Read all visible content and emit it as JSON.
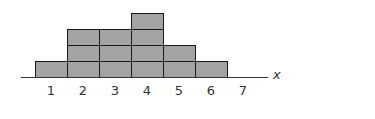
{
  "chart_data": {
    "type": "bar",
    "style": "stacked-unit-blocks histogram",
    "title": "",
    "xlabel": "x",
    "ylabel": "",
    "categories": [
      "1",
      "2",
      "3",
      "4",
      "5",
      "6",
      "7"
    ],
    "values": [
      1,
      3,
      3,
      4,
      2,
      1,
      0
    ],
    "ylim": [
      0,
      4
    ],
    "grid": false,
    "legend": null
  },
  "colors": {
    "block_fill": "#a3a3a3",
    "block_border": "#1a1a1a",
    "axis": "#333333",
    "text": "#333333"
  },
  "layout": {
    "origin_x": 35,
    "baseline_y": 77,
    "col_width": 32,
    "block_height": 16,
    "axis_start_x": 21,
    "axis_end_x": 268
  }
}
